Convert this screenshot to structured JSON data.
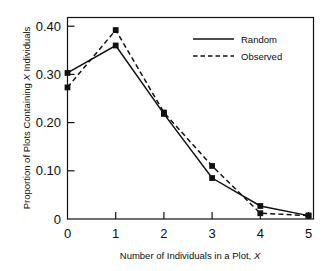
{
  "chart_data": {
    "type": "line",
    "title": "",
    "subtitle": "",
    "xlabel": "Number of Individuals in a Plot, X",
    "ylabel": "Proportion of Plots Containing X Individuals",
    "x": [
      0,
      1,
      2,
      3,
      4,
      5
    ],
    "xlim": [
      0,
      5
    ],
    "ylim": [
      0,
      0.43
    ],
    "xticks": [
      "0",
      "1",
      "2",
      "3",
      "4",
      "5"
    ],
    "yticks": [
      "0",
      "0.10",
      "0.20",
      "0.30",
      "0.40"
    ],
    "ytick_values": [
      0,
      0.1,
      0.2,
      0.3,
      0.4
    ],
    "grid": false,
    "legend_position": "top-right",
    "series": [
      {
        "name": "Random",
        "style": "solid",
        "marker": "square",
        "color": "#111111",
        "values": [
          0.303,
          0.36,
          0.218,
          0.085,
          0.027,
          0.007
        ]
      },
      {
        "name": "Observed",
        "style": "dashed",
        "marker": "square",
        "color": "#111111",
        "values": [
          0.273,
          0.392,
          0.221,
          0.11,
          0.012,
          0.007
        ]
      }
    ]
  },
  "legend": {
    "items": [
      {
        "label": "Random"
      },
      {
        "label": "Observed"
      }
    ]
  },
  "axes": {
    "x_title": "Number of Individuals in a Plot, X",
    "y_title": "Proportion of Plots Containing X Individuals",
    "x_title_prefix": "Number of Individuals in a Plot, ",
    "x_title_italic": "X",
    "y_title_prefix": "Proportion of Plots Containing ",
    "y_title_italic": "X",
    "y_title_suffix": " Individuals"
  },
  "colors": {
    "ink": "#111111",
    "background": "#ffffff"
  }
}
